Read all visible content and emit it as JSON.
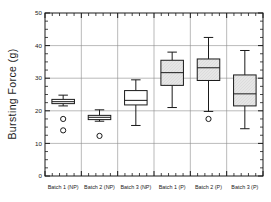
{
  "chart_data": {
    "type": "box",
    "title": "",
    "xlabel": "",
    "ylabel": "Bursting Force (g)",
    "ylim": [
      0,
      50
    ],
    "yticks": [
      0,
      10,
      20,
      30,
      40,
      50
    ],
    "ytick_labels": [
      "0",
      "10",
      "20",
      "30",
      "40",
      "50"
    ],
    "y_minor_tick_interval": 2.5,
    "grid": "horizontal major gridlines plus vertical category separators",
    "legend": "none",
    "categories": [
      "Batch 1 (NP)",
      "Batch 2 (NP)",
      "Batch 3 (NP)",
      "Batch 1 (P)",
      "Batch 2 (P)",
      "Batch 3 (P)"
    ],
    "boxes": [
      {
        "category": "Batch 1 (NP)",
        "whisker_low": 21.5,
        "q1": 22.2,
        "median": 22.8,
        "q3": 23.5,
        "whisker_high": 24.8,
        "outliers": [
          17.5,
          14.0
        ],
        "fill": "#ffffff"
      },
      {
        "category": "Batch 2 (NP)",
        "whisker_low": 16.8,
        "q1": 17.3,
        "median": 18.0,
        "q3": 18.6,
        "whisker_high": 20.3,
        "outliers": [
          12.3
        ],
        "fill": "#ffffff"
      },
      {
        "category": "Batch 3 (NP)",
        "whisker_low": 15.5,
        "q1": 21.8,
        "median": 23.2,
        "q3": 26.2,
        "whisker_high": 29.5,
        "outliers": [],
        "fill": "#ffffff"
      },
      {
        "category": "Batch 1 (P)",
        "whisker_low": 21.0,
        "q1": 27.8,
        "median": 31.7,
        "q3": 35.5,
        "whisker_high": 38.0,
        "outliers": [],
        "fill": "#e3e3e3"
      },
      {
        "category": "Batch 2 (P)",
        "whisker_low": 19.8,
        "q1": 29.3,
        "median": 33.2,
        "q3": 35.9,
        "whisker_high": 42.5,
        "outliers": [
          17.5
        ],
        "fill": "#e3e3e3"
      },
      {
        "category": "Batch 3 (P)",
        "whisker_low": 14.5,
        "q1": 21.5,
        "median": 25.2,
        "q3": 31.0,
        "whisker_high": 38.5,
        "outliers": [],
        "fill": "#e3e3e3"
      }
    ],
    "colors": {
      "axis": "#1a1a1a",
      "grid": "#8c8c8c",
      "box_stroke": "#1a1a1a",
      "box_fill_unshaded": "#ffffff",
      "box_fill_shaded": "#e3e3e3",
      "outlier_stroke": "#1a1a1a"
    }
  }
}
